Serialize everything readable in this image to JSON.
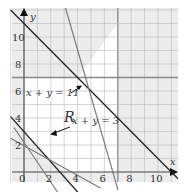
{
  "chart_data": {
    "type": "line",
    "title": "",
    "xlabel": "x",
    "ylabel": "y",
    "xlim": [
      -1,
      11.5
    ],
    "ylim": [
      -0.7,
      12
    ],
    "x_ticks": [
      "0",
      "2",
      "4",
      "6",
      "8",
      "10"
    ],
    "y_ticks": [
      "2",
      "4",
      "6",
      "8",
      "10"
    ],
    "grid": true,
    "region_label": "R",
    "region": {
      "description": "feasible region shaded white",
      "bounds": [
        "x >= 0",
        "y >= 0",
        "x <= 7",
        "y <= 7",
        "x + y >= 3",
        "x + y <= 11"
      ]
    },
    "series": [
      {
        "name": "x + y = 11",
        "style": "dark",
        "points": [
          [
            -1,
            12
          ],
          [
            11.5,
            -0.5
          ]
        ]
      },
      {
        "name": "x + y = 3",
        "style": "dark",
        "points": [
          [
            -1,
            4.1
          ],
          [
            4,
            -1.5
          ]
        ]
      },
      {
        "name": "steep-line-left",
        "style": "gray",
        "points": [
          [
            -0.75,
            3.3
          ],
          [
            2.5,
            -1.5
          ]
        ]
      },
      {
        "name": "shallow-line-left",
        "style": "gray",
        "points": [
          [
            -1,
            2.5
          ],
          [
            5.7,
            -1.2
          ]
        ]
      },
      {
        "name": "steep-line-right",
        "style": "gray",
        "points": [
          [
            3.1,
            12
          ],
          [
            7,
            -1.3
          ]
        ]
      }
    ],
    "annotations": [
      {
        "text": "x + y = 11",
        "arrow_to": [
          4.2,
          6.3
        ]
      },
      {
        "text": "x + y = 3",
        "arrow_to": [
          2.0,
          2.9
        ]
      }
    ]
  },
  "labels": {
    "x_axis": "x",
    "y_axis": "y",
    "region": "R",
    "eq1": "x + y = 11",
    "eq2": "x + y = 3",
    "ticks_x": [
      "0",
      "2",
      "4",
      "6",
      "8",
      "10"
    ],
    "ticks_y": [
      "2",
      "4",
      "6",
      "8",
      "10"
    ]
  }
}
